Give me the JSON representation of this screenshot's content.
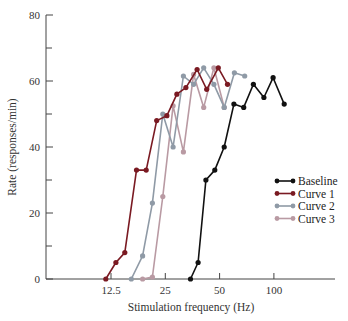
{
  "chart_data": {
    "type": "line",
    "title": "",
    "xlabel": "Stimulation frequency (Hz)",
    "ylabel": "Rate (responses/min)",
    "xscale": "log2",
    "xticks": [
      12.5,
      25,
      50,
      100
    ],
    "xtick_labels": [
      "12.5",
      "25",
      "50",
      "100"
    ],
    "yticks": [
      0,
      20,
      40,
      60,
      80
    ],
    "ytick_labels": [
      "0",
      "20",
      "40",
      "60",
      "80"
    ],
    "ylim": [
      0,
      80
    ],
    "xlim": [
      6.5,
      160
    ],
    "grid": false,
    "legend_position": "right-middle",
    "series": [
      {
        "name": "Baseline",
        "color": "#111111",
        "x": [
          34.5,
          38.0,
          42.0,
          47.0,
          53.0,
          60.0,
          68.0,
          77.0,
          88.0,
          99.0,
          114.0
        ],
        "y": [
          0,
          5,
          30,
          33,
          40,
          53,
          52,
          59,
          55,
          61,
          53
        ]
      },
      {
        "name": "Curve 1",
        "color": "#7a1a22",
        "x": [
          11.7,
          13.3,
          14.9,
          17.3,
          19.6,
          22.4,
          25.5,
          29.0,
          32.5,
          37.5,
          42.4,
          49.2,
          55.3
        ],
        "y": [
          0,
          5,
          8,
          33,
          33,
          48,
          49.5,
          56,
          58,
          63.5,
          57.5,
          64,
          59
        ]
      },
      {
        "name": "Curve 2",
        "color": "#8f9aa6",
        "x": [
          16.2,
          18.7,
          21.2,
          24.2,
          27.6,
          31.5,
          35.9,
          40.8,
          46.5,
          53.0,
          60.4,
          68.9
        ],
        "y": [
          0,
          7,
          23,
          50,
          40,
          61.5,
          59,
          64,
          59,
          52,
          62.5,
          61.5
        ]
      },
      {
        "name": "Curve 3",
        "color": "#b99aa3",
        "x": [
          18.7,
          21.2,
          24.2,
          27.6,
          31.5,
          35.9,
          40.8,
          46.5,
          53.0
        ],
        "y": [
          0,
          0.6,
          25,
          52.5,
          38.5,
          62,
          52,
          64,
          52
        ]
      }
    ]
  }
}
